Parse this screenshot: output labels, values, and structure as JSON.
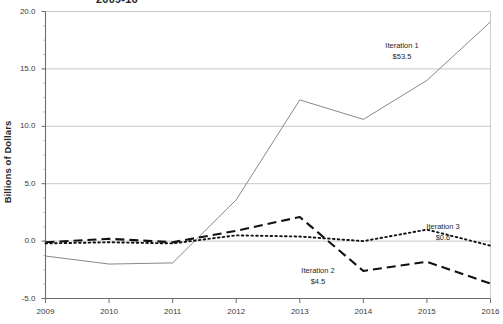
{
  "chart_data": {
    "type": "line",
    "title": "2009-16",
    "xlabel": "",
    "ylabel": "Billions of Dollars",
    "x": [
      2009,
      2010,
      2011,
      2012,
      2013,
      2014,
      2015,
      2016
    ],
    "xtick_labels": [
      "2009",
      "2010",
      "2011",
      "2012",
      "2013",
      "2014",
      "2015",
      "2016"
    ],
    "ytick_labels": [
      "20.0",
      "15.0",
      "10.0",
      "5.0",
      "0.0",
      "-5.0"
    ],
    "ytick_values": [
      20.0,
      15.0,
      10.0,
      5.0,
      0.0,
      -5.0
    ],
    "ylim": [
      -5.0,
      20.0
    ],
    "xlim": [
      2009,
      2016
    ],
    "grid": "horizontal-major",
    "minor_ticks": true,
    "legend": "inline-annotations",
    "series": [
      {
        "name": "Iteration 1",
        "label_value": "$53.5",
        "style": "solid",
        "color": "#7a7a7a",
        "width": 0.9,
        "values": [
          -1.3,
          -2.0,
          -1.9,
          3.6,
          12.3,
          10.6,
          14.0,
          19.1
        ]
      },
      {
        "name": "Iteration 2",
        "label_value": "$4.5",
        "style": "dashed",
        "color": "#121212",
        "width": 2.1,
        "values": [
          -0.1,
          0.2,
          -0.1,
          0.9,
          2.1,
          -2.6,
          -1.8,
          -3.7
        ]
      },
      {
        "name": "Iteration 3",
        "label_value": "$0.6",
        "style": "dotted",
        "color": "#121212",
        "width": 1.9,
        "values": [
          -0.2,
          -0.1,
          -0.2,
          0.5,
          0.4,
          0.0,
          1.0,
          -0.4
        ]
      }
    ],
    "annotations": [
      {
        "name": "Iteration 1",
        "value": "$53.5",
        "x_px": 402,
        "y_px": 41
      },
      {
        "name": "Iteration 2",
        "value": "$4.5",
        "x_px": 318,
        "y_px": 266
      },
      {
        "name": "Iteration 3",
        "value": "$0.6",
        "x_px": 443,
        "y_px": 222
      }
    ]
  },
  "colors": {
    "grid": "#b9b9b9",
    "axis": "#6e6e6e",
    "series_1": "#7a7a7a",
    "series_2": "#121212",
    "series_3": "#121212",
    "text": "#1f1f1f",
    "background": "#ffffff"
  }
}
